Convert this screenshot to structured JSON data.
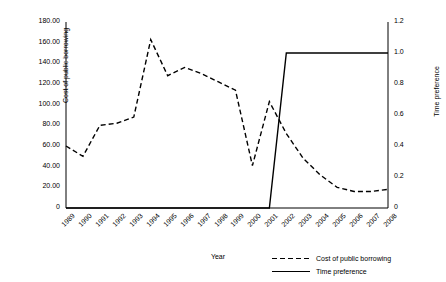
{
  "chart_data": {
    "type": "line",
    "title": "",
    "xlabel": "Year",
    "ylabel": "Cost of public borrowing",
    "ylabel_secondary": "Time preference",
    "grid": false,
    "legend_position": "bottom-right",
    "categories": [
      "1989",
      "1990",
      "1991",
      "1992",
      "1993",
      "1994",
      "1995",
      "1996",
      "1997",
      "1998",
      "1999",
      "2000",
      "2001",
      "2002",
      "2003",
      "2004",
      "2005",
      "2006",
      "2007",
      "2008"
    ],
    "ylim": [
      0,
      180
    ],
    "yticks": [
      "0",
      "20.00",
      "40.00",
      "60.00",
      "80.00",
      "100.00",
      "120.00",
      "140.00",
      "160.00",
      "180.00"
    ],
    "ylim_secondary": [
      0,
      1.2
    ],
    "yticks_secondary": [
      "0",
      "0.2",
      "0.4",
      "0.6",
      "0.8",
      "1.0",
      "1.2"
    ],
    "series": [
      {
        "name": "Cost of public borrowing",
        "axis": "left",
        "style": "dashed",
        "color": "#000000",
        "values": [
          60,
          50,
          80,
          82,
          88,
          163,
          128,
          136,
          130,
          122,
          114,
          41,
          103,
          72,
          48,
          32,
          20,
          16,
          16,
          18
        ]
      },
      {
        "name": "Time preference",
        "axis": "right",
        "style": "solid",
        "color": "#000000",
        "values": [
          0,
          0,
          0,
          0,
          0,
          0,
          0,
          0,
          0,
          0,
          0,
          0,
          0,
          1.0,
          1.0,
          1.0,
          1.0,
          1.0,
          1.0,
          1.0
        ]
      }
    ]
  },
  "legend": {
    "items": [
      {
        "label": "Cost of public borrowing",
        "style": "dashed"
      },
      {
        "label": "Time preference",
        "style": "solid"
      }
    ]
  }
}
